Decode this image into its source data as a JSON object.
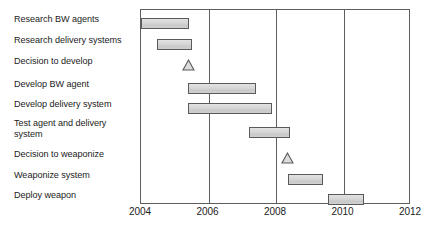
{
  "chart_data": {
    "type": "gantt",
    "title": "",
    "xlabel": "",
    "ylabel": "",
    "xlim": [
      2004,
      2012
    ],
    "grid": true,
    "legend": false,
    "axis": {
      "ticks": [
        2004,
        2006,
        2008,
        2010,
        2012
      ],
      "tick_labels": [
        "2004",
        "2006",
        "2008",
        "2010",
        "2012"
      ]
    },
    "tasks": [
      {
        "label": "Research BW agents",
        "kind": "bar",
        "start": 2004.0,
        "end": 2005.43,
        "color": "#d2d2d2"
      },
      {
        "label": "Research delivery systems",
        "kind": "bar",
        "start": 2004.48,
        "end": 2005.5,
        "color": "#d2d2d2"
      },
      {
        "label": "Decision to develop",
        "kind": "milestone",
        "start": 2005.42,
        "end": 2005.42,
        "color": "#d2d2d2"
      },
      {
        "label": "Develop BW agent",
        "kind": "bar",
        "start": 2005.4,
        "end": 2007.42,
        "color": "#d2d2d2"
      },
      {
        "label": "Develop delivery system",
        "kind": "bar",
        "start": 2005.4,
        "end": 2007.88,
        "color": "#d2d2d2"
      },
      {
        "label": "Test agent and delivery\nsystem",
        "kind": "bar",
        "start": 2007.2,
        "end": 2008.42,
        "color": "#d2d2d2"
      },
      {
        "label": "Decision to weaponize",
        "kind": "milestone",
        "start": 2008.35,
        "end": 2008.35,
        "color": "#d2d2d2"
      },
      {
        "label": "Weaponize system",
        "kind": "bar",
        "start": 2008.35,
        "end": 2009.4,
        "color": "#d2d2d2"
      },
      {
        "label": "Deploy weapon",
        "kind": "bar",
        "start": 2009.55,
        "end": 2010.6,
        "color": "#d2d2d2"
      }
    ]
  },
  "style": {
    "bar_fill": "#d2d2d2",
    "bar_border": "#5a5a5a",
    "axis_color": "#5e5e5e",
    "text_color": "#1b1b1b",
    "background": "#ffffff"
  }
}
